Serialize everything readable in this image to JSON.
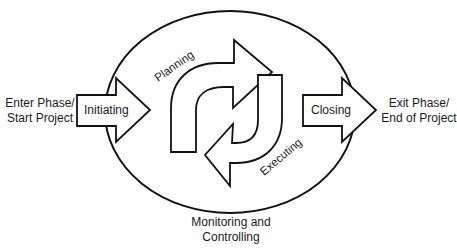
{
  "diagram": {
    "type": "project-lifecycle-cycle",
    "entry_label_line1": "Enter Phase/",
    "entry_label_line2": "Start Project",
    "exit_label_line1": "Exit Phase/",
    "exit_label_line2": "End of Project",
    "initiating": "Initiating",
    "planning": "Planning",
    "executing": "Executing",
    "closing": "Closing",
    "monitoring_line1": "Monitoring and",
    "monitoring_line2": "Controlling",
    "colors": {
      "stroke": "#111111",
      "fill": "#ffffff",
      "text": "#1a1a1a"
    }
  }
}
